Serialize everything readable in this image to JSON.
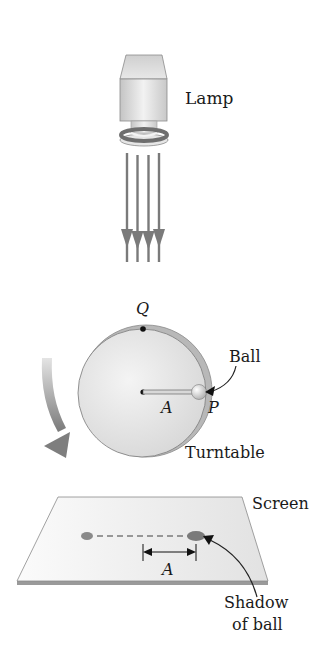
{
  "figure": {
    "labels": {
      "lamp": "Lamp",
      "q_point": "Q",
      "ball": "Ball",
      "amplitude_turntable": "A",
      "p_point": "P",
      "turntable": "Turntable",
      "screen": "Screen",
      "amplitude_screen": "A",
      "shadow_line1": "Shadow",
      "shadow_line2": "of ball"
    },
    "components": {
      "lamp": {
        "light_rays": 4
      },
      "turntable": {
        "rotation": "clockwise"
      },
      "screen": {
        "shadow_positions": [
          "center",
          "extreme"
        ]
      }
    },
    "colors": {
      "lamp_body": "#d8d8d8",
      "lamp_ring": "#6e6e6e",
      "rays": "#7a7a7a",
      "turntable_face": "#e6e6e6",
      "turntable_rim": "#b8b8b8",
      "rotation_arrow": "#8a8a8a",
      "screen": "#f0f0f0",
      "screen_edge": "#9a9a9a",
      "shadow": "#888888",
      "text": "#1a1a1a"
    }
  }
}
